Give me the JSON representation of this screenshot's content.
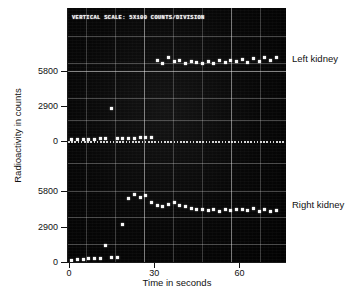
{
  "chart_data": {
    "type": "scatter",
    "title": "VERTICAL SCALE: 5X100 COUNTS/DIVISION",
    "xlabel": "Time in seconds",
    "ylabel": "Radioactivity in counts",
    "xlim": [
      0,
      75
    ],
    "xticks": [
      0,
      30,
      60
    ],
    "xticklabels": [
      "0",
      "30",
      "60"
    ],
    "grid": true,
    "legend_position": "right-inline",
    "panels": [
      {
        "name": "Left kidney",
        "ylim": [
          0,
          8700
        ],
        "yticks": [
          0,
          2900,
          5800
        ],
        "yticklabels": [
          "0",
          "2900",
          "5800"
        ],
        "series": [
          {
            "name": "Left kidney",
            "x": [
              1,
              3,
              5,
              7,
              9,
              11,
              13,
              15,
              17,
              19,
              21,
              23,
              25,
              27,
              29,
              31,
              33,
              35,
              37,
              39,
              41,
              43,
              45,
              47,
              49,
              51,
              53,
              55,
              57,
              59,
              61,
              63,
              65,
              67,
              69,
              71,
              73
            ],
            "y": [
              100,
              120,
              140,
              150,
              160,
              180,
              200,
              2700,
              220,
              210,
              230,
              240,
              250,
              260,
              280,
              6700,
              6450,
              6900,
              6550,
              6700,
              6400,
              6600,
              6500,
              6400,
              6550,
              6450,
              6700,
              6500,
              6650,
              6550,
              6750,
              6500,
              6850,
              6600,
              6900,
              6650,
              6950
            ]
          }
        ]
      },
      {
        "name": "Right kidney",
        "ylim": [
          0,
          8700
        ],
        "yticks": [
          0,
          2900,
          5800
        ],
        "yticklabels": [
          "0",
          "2900",
          "5800"
        ],
        "series": [
          {
            "name": "Right kidney",
            "x": [
              1,
              3,
              5,
              7,
              9,
              11,
              13,
              15,
              17,
              19,
              21,
              23,
              25,
              27,
              29,
              31,
              33,
              35,
              37,
              39,
              41,
              43,
              45,
              47,
              49,
              51,
              53,
              55,
              57,
              59,
              61,
              63,
              65,
              67,
              69,
              71,
              73
            ],
            "y": [
              120,
              180,
              230,
              260,
              300,
              320,
              1350,
              340,
              360,
              3100,
              5200,
              5500,
              5250,
              5400,
              4900,
              4600,
              4550,
              4700,
              4850,
              4650,
              4500,
              4350,
              4250,
              4300,
              4200,
              4300,
              4150,
              4300,
              4200,
              4250,
              4300,
              4200,
              4350,
              4150,
              4300,
              4100,
              4200
            ]
          }
        ]
      }
    ]
  }
}
